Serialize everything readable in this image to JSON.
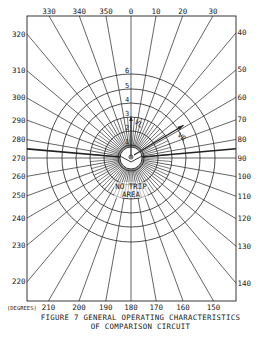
{
  "figure": {
    "caption_line1": "FIGURE 7  GENERAL OPERATING CHARACTERISTICS",
    "caption_line2": "OF COMPARISON CIRCUIT",
    "units_label": "(DEGREES)",
    "center_label": "NO TRIP",
    "center_label2": "AREA",
    "vector_left": "VL",
    "vector_right": "VR"
  },
  "diagram": {
    "center": [
      131,
      158
    ],
    "frame": {
      "x": 27,
      "y": 16,
      "w": 209,
      "h": 285
    },
    "inner_radius": 11,
    "ring_radii": [
      13,
      27,
      41,
      55,
      69,
      84
    ],
    "ring_labels": [
      "1",
      "2",
      "3",
      "4",
      "5",
      "6"
    ],
    "radial_step_deg": 10,
    "heavy_lines_deg": [
      85,
      275
    ],
    "angle_labels": {
      "top": [
        "330",
        "340",
        "350",
        "0",
        "10",
        "20",
        "30"
      ],
      "right": [
        "40",
        "50",
        "60",
        "70",
        "80",
        "90",
        "100",
        "110",
        "120",
        "130",
        "140"
      ],
      "left": [
        "320",
        "310",
        "300",
        "290",
        "280",
        "270",
        "260",
        "250",
        "240",
        "230",
        "220"
      ],
      "bottom": [
        "210",
        "200",
        "190",
        "180",
        "170",
        "160",
        "150"
      ]
    },
    "stroke_color": "#222222",
    "background": "#ffffff"
  }
}
